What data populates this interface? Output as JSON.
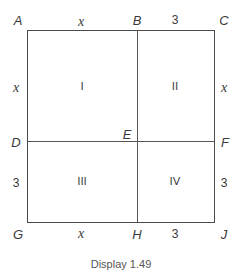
{
  "figure": {
    "caption": "Display 1.49",
    "points": {
      "A": "A",
      "B": "B",
      "C": "C",
      "D": "D",
      "E": "E",
      "F": "F",
      "G": "G",
      "H": "H",
      "J": "J"
    },
    "top_labels": [
      "x",
      "3"
    ],
    "bottom_labels": [
      "x",
      "3"
    ],
    "left_labels": [
      "x",
      "3"
    ],
    "right_labels": [
      "x",
      "3"
    ],
    "regions": [
      "I",
      "II",
      "III",
      "IV"
    ],
    "colors": {
      "line": "#4a4a4a",
      "text": "#3a3a3a",
      "background": "#ffffff"
    }
  }
}
